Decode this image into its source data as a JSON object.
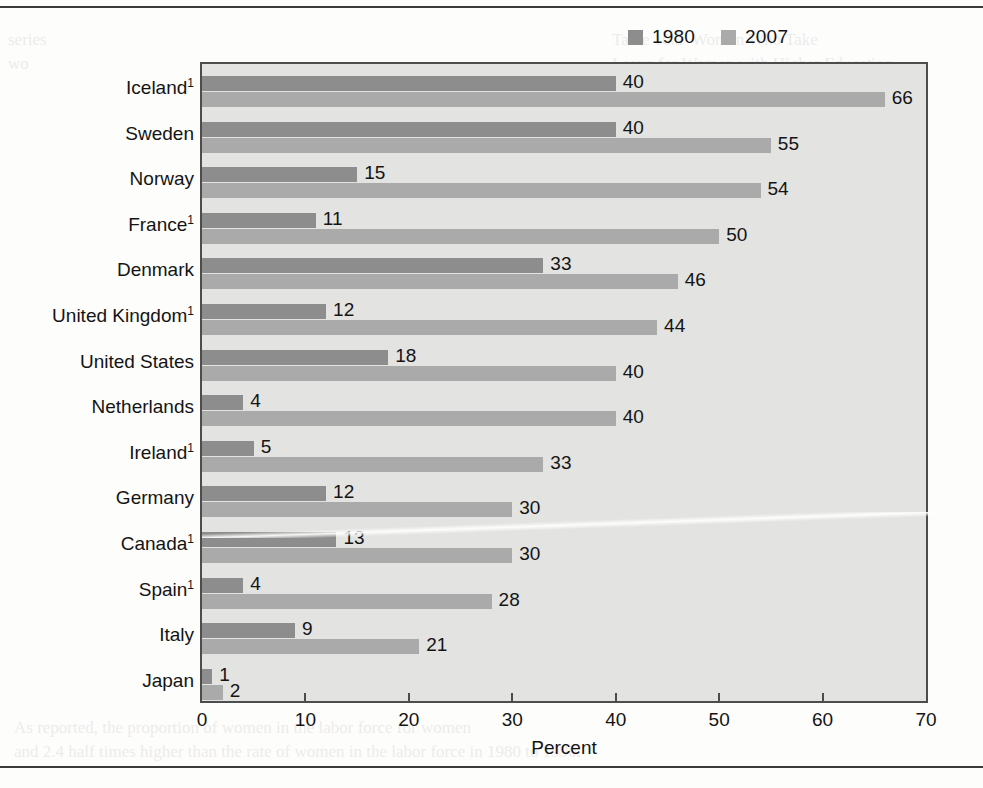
{
  "chart_data": {
    "type": "bar",
    "orientation": "horizontal",
    "title": "",
    "xlabel": "Percent",
    "ylabel": "",
    "xlim": [
      0,
      70
    ],
    "xticks": [
      0,
      10,
      20,
      30,
      40,
      50,
      60,
      70
    ],
    "grid": false,
    "legend_position": "top-right",
    "categories": [
      "Iceland",
      "Sweden",
      "Norway",
      "France",
      "Denmark",
      "United Kingdom",
      "United States",
      "Netherlands",
      "Ireland",
      "Germany",
      "Canada",
      "Spain",
      "Italy",
      "Japan"
    ],
    "category_footnotes": [
      "1",
      "",
      "",
      "1",
      "",
      "1",
      "",
      "",
      "1",
      "",
      "1",
      "1",
      "",
      ""
    ],
    "series": [
      {
        "name": "1980",
        "color": "#8d8d8d",
        "values": [
          40,
          40,
          15,
          11,
          33,
          12,
          18,
          4,
          5,
          12,
          13,
          4,
          9,
          1
        ]
      },
      {
        "name": "2007",
        "color": "#aaaaaa",
        "values": [
          66,
          55,
          54,
          50,
          46,
          44,
          40,
          40,
          33,
          30,
          30,
          28,
          21,
          2
        ]
      }
    ]
  },
  "legend": {
    "items": [
      {
        "label": "1980",
        "color": "#8d8d8d"
      },
      {
        "label": "2007",
        "color": "#aaaaaa"
      }
    ]
  },
  "axis": {
    "x_title": "Percent",
    "tick_labels": [
      "0",
      "10",
      "20",
      "30",
      "40",
      "50",
      "60",
      "70"
    ]
  },
  "page_bleed": {
    "right_column": "Table 10.2  Women Who Take\nLeave for Women with Higher Education\n\nCountry and its half-sampled\ncountry. To work — the longer it can\nbe. Other international work is\nthe education level across\n(see table 10.2). This is essential\nthe range of women in the workplace\nof leaving, work wage gap\nnearly 20 in America as women\nwith as have your had children have\nthe average adult in one in part-time\nthey both different U.S. women degree\nmen are standard at one such children\nthe below in so other technology, become\nworld used advances by those sectors\nand migration.\n\n\nMigration\n\nworkers is a different point and which\nwas 2.4 million international workers.",
    "left_column": "series\nwo\n\n\n\n\n\n\n\n\n\n\n\n",
    "bottom_band": "As reported, the proportion of women in the labor force for women\nand 2.4 half times higher than the rate of women in the labor force in 1980 to 1990."
  }
}
